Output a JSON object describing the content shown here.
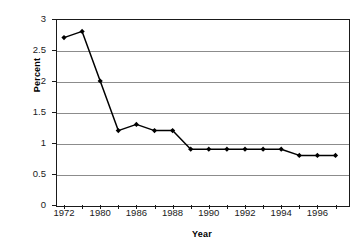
{
  "chart_data": {
    "type": "line",
    "title": "",
    "xlabel": "Year",
    "ylabel": "Percent",
    "ylim": [
      0,
      3
    ],
    "yticks": [
      0,
      0.5,
      1,
      1.5,
      2,
      2.5,
      3
    ],
    "ytick_labels": [
      "0",
      "0.5",
      "1",
      "1.5",
      "2",
      "2.5",
      "3"
    ],
    "xtick_labels": [
      "1972",
      "1980",
      "1986",
      "1988",
      "1990",
      "1992",
      "1994",
      "1996"
    ],
    "grid": true,
    "legend": false,
    "legend_position": "none",
    "marker": "filled-diamond",
    "line_color": "#000000",
    "marker_color": "#000000",
    "grid_color": "#8c8c8c",
    "categories": [
      "1972",
      "1976",
      "1980",
      "1984",
      "1986",
      "1987",
      "1988",
      "1989",
      "1990",
      "1991",
      "1992",
      "1993",
      "1994",
      "1995",
      "1996",
      "1997"
    ],
    "values": [
      2.7,
      2.8,
      2.0,
      1.2,
      1.3,
      1.2,
      1.2,
      0.9,
      0.9,
      0.9,
      0.9,
      0.9,
      0.9,
      0.8,
      0.8,
      0.8
    ],
    "series": [
      {
        "name": "Percent",
        "values": [
          2.7,
          2.8,
          2.0,
          1.2,
          1.3,
          1.2,
          1.2,
          0.9,
          0.9,
          0.9,
          0.9,
          0.9,
          0.9,
          0.8,
          0.8,
          0.8
        ]
      }
    ]
  },
  "axis": {
    "y_title": "Percent",
    "x_title": "Year"
  }
}
